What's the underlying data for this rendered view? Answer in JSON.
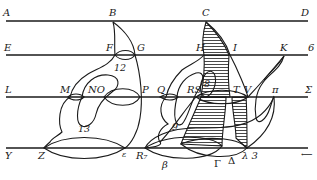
{
  "diagram": {
    "title": "",
    "lines": [
      {
        "id": "line-1",
        "y": 21,
        "left_label": "A",
        "right_label": "D"
      },
      {
        "id": "line-2",
        "y": 55,
        "left_label": "E",
        "right_label": "6"
      },
      {
        "id": "line-3",
        "y": 97,
        "left_label": "L",
        "right_label": "Σ"
      },
      {
        "id": "line-4",
        "y": 148,
        "left_label": "Y",
        "right_label": "⟵"
      }
    ],
    "labels": {
      "A": "A",
      "B": "B",
      "C": "C",
      "D": "D",
      "E": "E",
      "F": "F",
      "G": "G",
      "H": "H",
      "I": "I",
      "K": "K",
      "six": "6",
      "L": "L",
      "M": "M",
      "NO": "NO",
      "P": "P",
      "Q": "Q",
      "RS": "RS",
      "T": "T",
      "V": "V",
      "pi": "π",
      "Sigma": "Σ",
      "Y": "Y",
      "Z": "Z",
      "epsilon": "ε",
      "R7": "R₇",
      "beta": "β",
      "Gamma": "Γ",
      "Delta": "Δ",
      "lambda3": "λ 3",
      "arrow": "⟵"
    },
    "region_numbers": {
      "n12": "12",
      "n13": "13",
      "n9": "9",
      "n8": "8"
    },
    "colors": {
      "ink": "#1a1a1a",
      "background": "#ffffff"
    }
  }
}
